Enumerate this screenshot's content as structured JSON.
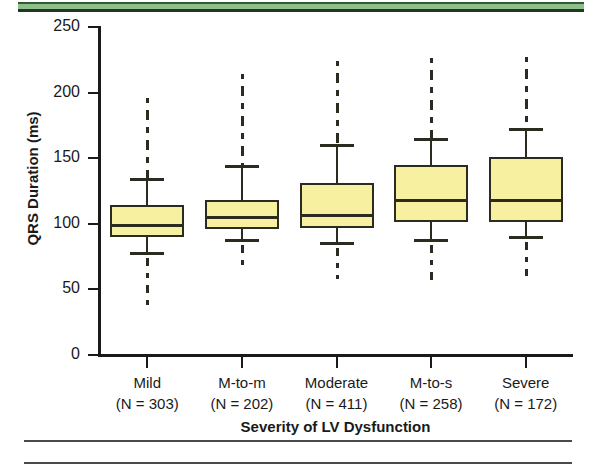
{
  "figure": {
    "y_axis_title": "QRS Duration (ms)",
    "x_axis_title": "Severity of LV Dysfunction",
    "y_ticks": [
      "250",
      "200",
      "150",
      "100",
      "50",
      "0"
    ],
    "box_fill_color": "#f6f0a0",
    "box_line_color": "#2b2b20",
    "band_color": "#8fbf8a"
  },
  "chart_data": {
    "type": "box",
    "title": "",
    "xlabel": "Severity of LV Dysfunction",
    "ylabel": "QRS Duration (ms)",
    "ylim": [
      0,
      250
    ],
    "ytick_values": [
      0,
      50,
      100,
      150,
      200,
      250
    ],
    "grid": false,
    "legend": "none",
    "categories": [
      "Mild",
      "M-to-m",
      "Moderate",
      "M-to-s",
      "Severe"
    ],
    "category_counts": [
      303,
      202,
      411,
      258,
      172
    ],
    "category_labels": [
      "(N = 303)",
      "(N = 202)",
      "(N = 411)",
      "(N = 258)",
      "(N = 172)"
    ],
    "boxes": [
      {
        "category": "Mild",
        "n": 303,
        "whisker_low": 78,
        "q1": 90,
        "median": 99,
        "q3": 114,
        "whisker_high": 134,
        "outlier_low": 37,
        "outlier_high": 196
      },
      {
        "category": "M-to-m",
        "n": 202,
        "whisker_low": 88,
        "q1": 96,
        "median": 105,
        "q3": 118,
        "whisker_high": 144,
        "outlier_low": 64,
        "outlier_high": 214
      },
      {
        "category": "Moderate",
        "n": 411,
        "whisker_low": 85,
        "q1": 97,
        "median": 107,
        "q3": 131,
        "whisker_high": 160,
        "outlier_low": 58,
        "outlier_high": 224
      },
      {
        "category": "M-to-s",
        "n": 258,
        "whisker_low": 88,
        "q1": 101,
        "median": 118,
        "q3": 145,
        "whisker_high": 165,
        "outlier_low": 57,
        "outlier_high": 226
      },
      {
        "category": "Severe",
        "n": 172,
        "whisker_low": 90,
        "q1": 101,
        "median": 118,
        "q3": 151,
        "whisker_high": 172,
        "outlier_low": 60,
        "outlier_high": 227
      }
    ]
  }
}
